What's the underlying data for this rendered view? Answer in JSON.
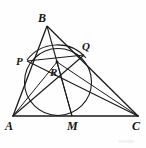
{
  "figure": {
    "kind": "geometry-diagram",
    "caption": "",
    "stroke_color": "#1a1a1a",
    "label_color": "#141414",
    "background_color": "#fefefe"
  },
  "labels": {
    "a": "A",
    "b": "B",
    "c": "C",
    "p": "P",
    "q": "Q",
    "r": "R",
    "m": "M"
  },
  "points": {
    "A": {
      "x": 13,
      "y": 116
    },
    "B": {
      "x": 47,
      "y": 26
    },
    "C": {
      "x": 138,
      "y": 116
    },
    "P": {
      "x": 28,
      "y": 61
    },
    "Q": {
      "x": 83,
      "y": 55
    },
    "R": {
      "x": 57,
      "y": 62
    },
    "M": {
      "x": 72,
      "y": 116
    }
  },
  "label_positions": {
    "A": {
      "x": 6,
      "y": 120
    },
    "B": {
      "x": 38,
      "y": 12
    },
    "C": {
      "x": 133,
      "y": 120
    },
    "P": {
      "x": 16,
      "y": 57
    },
    "Q": {
      "x": 82,
      "y": 41
    },
    "R": {
      "x": 50,
      "y": 67
    },
    "M": {
      "x": 68,
      "y": 120
    }
  },
  "segments": [
    {
      "name": "side-ab",
      "from": "A",
      "to": "B"
    },
    {
      "name": "side-bc",
      "from": "B",
      "to": "C"
    },
    {
      "name": "side-ac",
      "from": "A",
      "to": "C"
    },
    {
      "name": "cevian-bm",
      "from": "B",
      "to": "M"
    },
    {
      "name": "cevian-cp",
      "from": "C",
      "to": "P"
    },
    {
      "name": "cevian-aq",
      "from": "A",
      "to": "Q"
    },
    {
      "name": "segment-pq",
      "from": "P",
      "to": "Q"
    },
    {
      "name": "segment-ar",
      "from": "A",
      "to": "R"
    },
    {
      "name": "segment-rm",
      "from": "R",
      "to": "M"
    }
  ],
  "circles": [
    {
      "name": "inner-circle",
      "cx": 58,
      "cy": 82,
      "r": 33.5
    },
    {
      "name": "circumscribed-arc-pbq",
      "cx": 56,
      "cy": 86,
      "r": 39
    }
  ]
}
